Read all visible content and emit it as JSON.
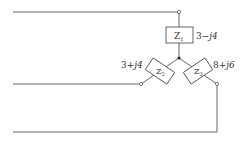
{
  "diagram": {
    "type": "three-phase wye load",
    "line_color": "#555555",
    "impedances": [
      {
        "id": "Z1",
        "label": "Z",
        "sub": "1",
        "value_re": "3",
        "value_sign": "−",
        "value_im": "j4"
      },
      {
        "id": "Z2",
        "label": "Z",
        "sub": "2",
        "value_re": "3",
        "value_sign": "+",
        "value_im": "j4"
      },
      {
        "id": "Z3",
        "label": "Z",
        "sub": "3",
        "value_re": "8",
        "value_sign": "+",
        "value_im": "j6"
      }
    ],
    "value_labels": {
      "z1": "3−j4",
      "z2": "3+j4",
      "z3": "8+j6"
    }
  }
}
